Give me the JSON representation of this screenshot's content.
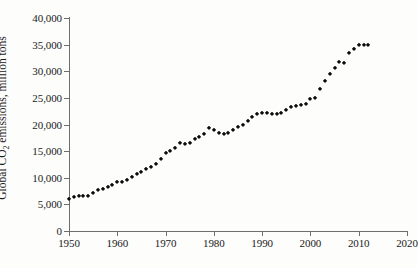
{
  "chart_data": {
    "type": "scatter",
    "title": "",
    "xlabel": "",
    "ylabel_prefix": "Global CO",
    "ylabel_sub": "2",
    "ylabel_suffix": " emissions, million tons",
    "ylabel_full": "Global CO2 emissions, million tons",
    "xlim": [
      1950,
      2020
    ],
    "ylim": [
      0,
      40000
    ],
    "grid": false,
    "legend": null,
    "marker_color": "#0c0c0c",
    "axis_color": "#6e6e6e",
    "background_color": "#fdfdfc",
    "xticks": [
      1950,
      1960,
      1970,
      1980,
      1990,
      2000,
      2010,
      2020
    ],
    "xtick_labels": [
      "1950",
      "1960",
      "1970",
      "1980",
      "1990",
      "2000",
      "2010",
      "2020"
    ],
    "yticks": [
      0,
      5000,
      10000,
      15000,
      20000,
      25000,
      30000,
      35000,
      40000
    ],
    "ytick_labels": [
      "0",
      "5,000",
      "10,000",
      "15,000",
      "20,000",
      "25,000",
      "30,000",
      "35,000",
      "40,000"
    ],
    "x": [
      1950,
      1951,
      1952,
      1953,
      1954,
      1955,
      1956,
      1957,
      1958,
      1959,
      1960,
      1961,
      1962,
      1963,
      1964,
      1965,
      1966,
      1967,
      1968,
      1969,
      1970,
      1971,
      1972,
      1973,
      1974,
      1975,
      1976,
      1977,
      1978,
      1979,
      1980,
      1981,
      1982,
      1983,
      1984,
      1985,
      1986,
      1987,
      1988,
      1989,
      1990,
      1991,
      1992,
      1993,
      1994,
      1995,
      1996,
      1997,
      1998,
      1999,
      2000,
      2001,
      2002,
      2003,
      2004,
      2005,
      2006,
      2007,
      2008,
      2009,
      2010,
      2011,
      2012
    ],
    "values": [
      6000,
      6450,
      6500,
      6600,
      6650,
      7200,
      7650,
      7950,
      8250,
      8650,
      9150,
      9200,
      9500,
      10100,
      10700,
      11150,
      11700,
      12000,
      12600,
      13550,
      14600,
      15000,
      15600,
      16550,
      16400,
      16450,
      17300,
      17700,
      18150,
      19400,
      18950,
      18350,
      18300,
      18350,
      19050,
      19550,
      20000,
      20600,
      21450,
      21900,
      22100,
      22150,
      21950,
      22050,
      22250,
      22700,
      23250,
      23500,
      23700,
      23800,
      24700,
      25050,
      26750,
      28200,
      29450,
      30700,
      31650,
      31550,
      33500,
      34100,
      35000,
      35000,
      35000
    ]
  }
}
